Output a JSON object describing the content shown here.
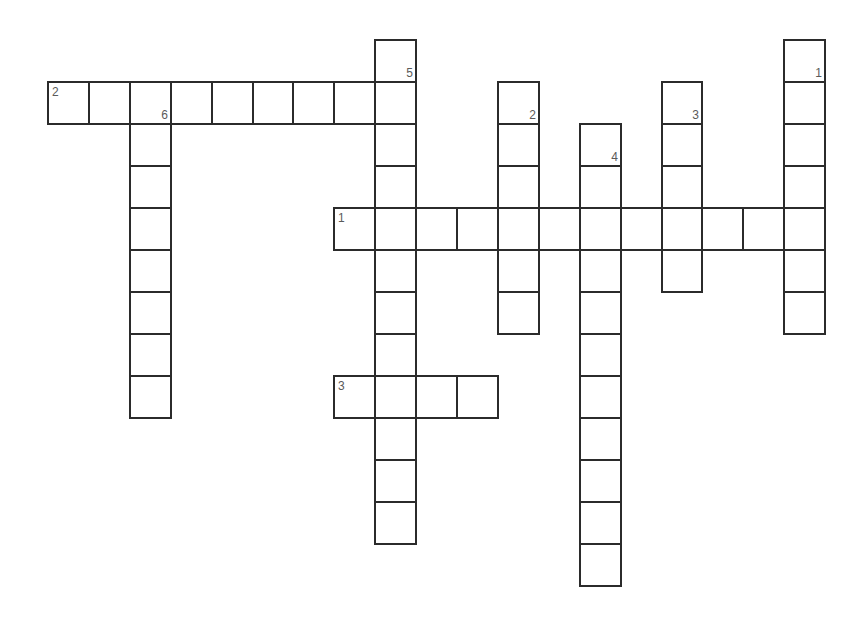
{
  "puzzle": {
    "title": "",
    "background": "#ffffff",
    "line_color": "#2b2b2b",
    "label_color": "#5a5a5a",
    "grid": {
      "origin_x": 48,
      "origin_y": 40,
      "cell_w": 40.9,
      "cell_h": 42
    },
    "across": [
      {
        "number": "2",
        "label": "2",
        "row": 1,
        "col": 0,
        "length": 9
      },
      {
        "number": "1",
        "label": "1",
        "row": 4,
        "col": 7,
        "length": 12
      },
      {
        "number": "3",
        "label": "3",
        "row": 8,
        "col": 7,
        "length": 4
      }
    ],
    "down": [
      {
        "number": "5",
        "label": "5",
        "row": 0,
        "col": 8,
        "length": 12
      },
      {
        "number": "6",
        "label": "6",
        "row": 1,
        "col": 2,
        "length": 8
      },
      {
        "number": "2",
        "label": "2",
        "row": 1,
        "col": 11,
        "length": 6
      },
      {
        "number": "4",
        "label": "4",
        "row": 2,
        "col": 13,
        "length": 11
      },
      {
        "number": "3",
        "label": "3",
        "row": 1,
        "col": 15,
        "length": 5
      },
      {
        "number": "1",
        "label": "1",
        "row": 0,
        "col": 18,
        "length": 7
      }
    ]
  }
}
